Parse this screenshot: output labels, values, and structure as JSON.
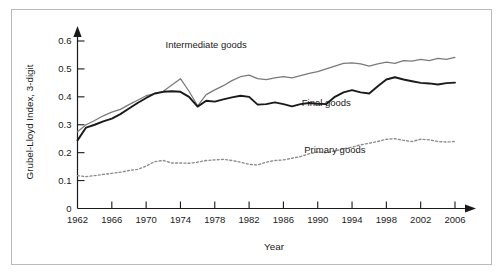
{
  "chart_data": {
    "type": "line",
    "title": "",
    "xlabel": "Year",
    "ylabel": "Grubel-Lloyd Index, 3-digit",
    "xlim": [
      1962,
      2006
    ],
    "ylim": [
      0,
      0.65
    ],
    "grid": false,
    "legend_position": "inline-annotations",
    "x_ticks": [
      "1962",
      "1966",
      "1970",
      "1974",
      "1978",
      "1982",
      "1986",
      "1990",
      "1994",
      "1998",
      "2002",
      "2006"
    ],
    "y_ticks": [
      "0",
      "0.1",
      "0.2",
      "0.3",
      "0.4",
      "0.5",
      "0.6"
    ],
    "x": [
      1962,
      1963,
      1964,
      1965,
      1966,
      1967,
      1968,
      1969,
      1970,
      1971,
      1972,
      1973,
      1974,
      1975,
      1976,
      1977,
      1978,
      1979,
      1980,
      1981,
      1982,
      1983,
      1984,
      1985,
      1986,
      1987,
      1988,
      1989,
      1990,
      1991,
      1992,
      1993,
      1994,
      1995,
      1996,
      1997,
      1998,
      1999,
      2000,
      2001,
      2002,
      2003,
      2004,
      2005,
      2006
    ],
    "series": [
      {
        "name": "Intermediate goods",
        "style": "solid-gray",
        "color": "#7a7a7a",
        "label_x": 1977,
        "label_y": 0.575,
        "values": [
          0.275,
          0.3,
          0.315,
          0.332,
          0.345,
          0.355,
          0.372,
          0.388,
          0.404,
          0.412,
          0.42,
          0.442,
          0.465,
          0.42,
          0.368,
          0.408,
          0.425,
          0.44,
          0.458,
          0.472,
          0.478,
          0.465,
          0.462,
          0.468,
          0.472,
          0.468,
          0.476,
          0.484,
          0.49,
          0.5,
          0.51,
          0.52,
          0.522,
          0.518,
          0.51,
          0.518,
          0.524,
          0.52,
          0.53,
          0.528,
          0.534,
          0.53,
          0.538,
          0.534,
          0.541
        ]
      },
      {
        "name": "Final goods",
        "style": "solid-black",
        "color": "#1a1a1a",
        "label_x": 1991,
        "label_y": 0.368,
        "values": [
          0.244,
          0.29,
          0.3,
          0.312,
          0.322,
          0.338,
          0.358,
          0.378,
          0.396,
          0.412,
          0.418,
          0.42,
          0.418,
          0.4,
          0.365,
          0.386,
          0.383,
          0.391,
          0.398,
          0.404,
          0.4,
          0.372,
          0.374,
          0.38,
          0.374,
          0.366,
          0.374,
          0.378,
          0.375,
          0.374,
          0.4,
          0.416,
          0.424,
          0.416,
          0.412,
          0.438,
          0.462,
          0.47,
          0.462,
          0.456,
          0.45,
          0.448,
          0.444,
          0.449,
          0.451
        ]
      },
      {
        "name": "Primary goods",
        "style": "dotted-gray",
        "color": "#8c8c8c",
        "label_x": 1992,
        "label_y": 0.2,
        "values": [
          0.118,
          0.114,
          0.118,
          0.122,
          0.126,
          0.13,
          0.136,
          0.14,
          0.152,
          0.168,
          0.172,
          0.163,
          0.163,
          0.162,
          0.166,
          0.172,
          0.174,
          0.176,
          0.172,
          0.166,
          0.158,
          0.156,
          0.166,
          0.172,
          0.174,
          0.18,
          0.186,
          0.196,
          0.202,
          0.2,
          0.206,
          0.214,
          0.22,
          0.228,
          0.234,
          0.24,
          0.248,
          0.25,
          0.244,
          0.24,
          0.248,
          0.246,
          0.24,
          0.238,
          0.24
        ]
      }
    ]
  }
}
